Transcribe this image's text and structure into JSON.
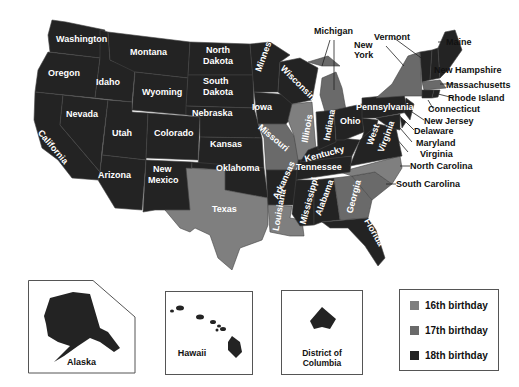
{
  "colors": {
    "sixteenth": "#7f7f7f",
    "seventeenth": "#6a6a6a",
    "eighteenth": "#232323",
    "none": "#ffffff",
    "border": "#555555"
  },
  "states": {
    "washington": "Washington",
    "oregon": "Oregon",
    "california": "California",
    "idaho": "Idaho",
    "nevada": "Nevada",
    "montana": "Montana",
    "wyoming": "Wyoming",
    "utah": "Utah",
    "arizona": "Arizona",
    "colorado": "Colorado",
    "new_mexico_1": "New",
    "new_mexico_2": "Mexico",
    "north_dakota_1": "North",
    "north_dakota_2": "Dakota",
    "south_dakota_1": "South",
    "south_dakota_2": "Dakota",
    "nebraska": "Nebraska",
    "kansas": "Kansas",
    "oklahoma": "Oklahoma",
    "texas": "Texas",
    "minnesota": "Minnesota",
    "iowa": "Iowa",
    "missouri": "Missouri",
    "arkansas": "Arkansas",
    "louisiana": "Louisiana",
    "wisconsin": "Wisconsin",
    "illinois": "Illinois",
    "michigan": "Michigan",
    "indiana": "Indiana",
    "ohio": "Ohio",
    "kentucky": "Kentucky",
    "tennessee": "Tennessee",
    "mississippi": "Mississippi",
    "alabama": "Alabama",
    "georgia": "Georgia",
    "florida": "Florida",
    "south_carolina": "South Carolina",
    "north_carolina": "North Carolina",
    "virginia": "Virginia",
    "west_virginia_1": "West",
    "west_virginia_2": "Virginia",
    "maryland": "Maryland",
    "delaware": "Delaware",
    "new_jersey": "New Jersey",
    "pennsylvania": "Pennsylvania",
    "new_york_1": "New",
    "new_york_2": "York",
    "connecticut": "Connecticut",
    "rhode_island": "Rhode Island",
    "massachusetts": "Massachusetts",
    "new_hampshire": "New Hampshire",
    "vermont": "Vermont",
    "maine": "Maine"
  },
  "insets": {
    "alaska": "Alaska",
    "hawaii": "Hawaii",
    "dc": "District of Columbia"
  },
  "legend": {
    "items": [
      {
        "label": "16th birthday"
      },
      {
        "label": "17th birthday"
      },
      {
        "label": "18th birthday"
      }
    ]
  }
}
